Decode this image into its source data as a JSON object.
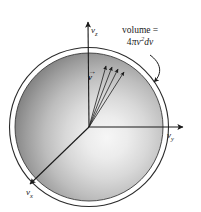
{
  "figure": {
    "name": "maxwell-speed-distribution-velocity-space-sphere",
    "background_color": "#ffffff",
    "sphere": {
      "center_x": 89,
      "center_y": 127,
      "inner_radius": 74,
      "outer_radius": 80,
      "shading": "radial-gradient",
      "highlight_color": "#f2f2f2",
      "edge_color": "#4a4a4a",
      "outline_color": "#2b2b2b"
    },
    "axes": [
      {
        "id": "vz",
        "label": "v",
        "subscript": "z",
        "direction": "up",
        "from": [
          89,
          127
        ],
        "to": [
          88,
          19
        ],
        "arrowhead": true
      },
      {
        "id": "vy",
        "label": "v",
        "subscript": "y",
        "direction": "right",
        "from": [
          89,
          127
        ],
        "to": [
          186,
          127
        ],
        "arrowhead": true
      },
      {
        "id": "vx",
        "label": "v",
        "subscript": "x",
        "direction": "lower-left",
        "from": [
          89,
          127
        ],
        "to": [
          27,
          187
        ],
        "arrowhead": true
      }
    ],
    "vector": {
      "id": "v-vector",
      "label": "v",
      "accent": "→",
      "description": "velocity vector with overhead arrow",
      "label_x": 90,
      "label_y": 72
    },
    "shell_rays": {
      "description": "narrow bundle of rays from origin to sphere surface defining a solid-angle wedge",
      "count": 4,
      "origin": [
        89,
        127
      ],
      "endpoints": [
        [
          108,
          64
        ],
        [
          114,
          65
        ],
        [
          120,
          67
        ],
        [
          126,
          70
        ]
      ]
    },
    "annotation": {
      "id": "volume-annotation",
      "line1": "volume =",
      "line2_prefix": "4",
      "line2_pi": "π",
      "line2_v": "v",
      "line2_exp": "2",
      "line2_suffix": "dv",
      "line2_plain": "4πv²dv",
      "text_x": 126,
      "text_y": 30,
      "leader_line": {
        "description": "curved leader arrow from annotation down-left to sphere rim",
        "start": [
          150,
          56
        ],
        "control": [
          162,
          68
        ],
        "end": [
          153,
          82
        ],
        "arrowhead": true
      }
    }
  }
}
